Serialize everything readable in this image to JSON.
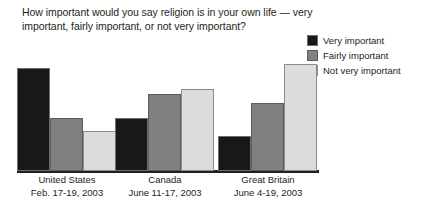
{
  "title": "How important would you say religion is in your own life — very important, fairly important, or not very important?",
  "legend": {
    "items": [
      {
        "label": "Very important",
        "color": "#1a1718",
        "key": "very"
      },
      {
        "label": "Fairly important",
        "color": "#808080",
        "key": "fairly"
      },
      {
        "label": "Not very important",
        "color": "#dcdcdc",
        "key": "notvery"
      }
    ]
  },
  "categories": [
    {
      "name": "United States",
      "date": "Feb. 17-19, 2003"
    },
    {
      "name": "Canada",
      "date": "June 11-17, 2003"
    },
    {
      "name": "Great Britain",
      "date": "June 4-19, 2003"
    }
  ],
  "chart_data": {
    "type": "bar",
    "title": "How important would you say religion is in your own life — very important, fairly important, or not very important?",
    "xlabel": "",
    "ylabel": "",
    "ylim": [
      0,
      100
    ],
    "grid": false,
    "legend_position": "top-right",
    "categories": [
      "United States",
      "Canada",
      "Great Britain"
    ],
    "category_dates": [
      "Feb. 17-19, 2003",
      "June 11-17, 2003",
      "June 4-19, 2003"
    ],
    "series": [
      {
        "name": "Very important",
        "color": "#1a1718",
        "values": [
          59,
          30,
          20
        ]
      },
      {
        "name": "Fairly important",
        "color": "#808080",
        "values": [
          30,
          44,
          39
        ]
      },
      {
        "name": "Not very important",
        "color": "#dcdcdc",
        "values": [
          23,
          47,
          61
        ]
      }
    ]
  },
  "layout": {
    "group_left": [
      17,
      115,
      218
    ],
    "group_width": 100,
    "bar_width": 33,
    "bar_gap": 0,
    "plot_height_px": 113,
    "value_scale_max": 65
  }
}
